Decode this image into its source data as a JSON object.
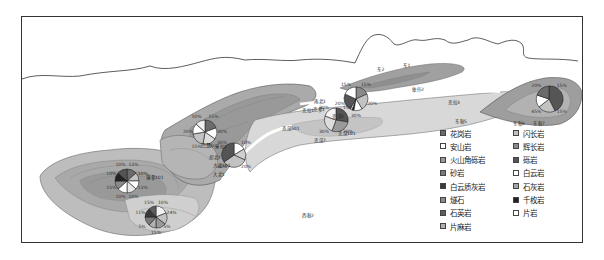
{
  "figure": {
    "frame_color": "#333333",
    "background": "#ffffff"
  },
  "wells": [
    {
      "id": "w1",
      "label": "蒲参1",
      "pie": {
        "cx": 127,
        "cy": 181,
        "r": 12
      },
      "pcts": [
        "13%",
        "10%",
        "13%",
        "10%",
        "10%",
        "15%",
        "10%",
        "10%"
      ]
    },
    {
      "id": "w2",
      "label": "玛参1",
      "pie": {
        "cx": 156,
        "cy": 217,
        "r": 11
      },
      "pcts": [
        "10%",
        "24%",
        "5%",
        "15%",
        "5%",
        "11%",
        "15%"
      ]
    },
    {
      "id": "w3",
      "label": "大北1",
      "pie": {
        "cx": 234,
        "cy": 155,
        "r": 12
      },
      "pcts": [
        "10%",
        "20%",
        "40%",
        "30%"
      ]
    },
    {
      "id": "w4",
      "label": "克深1",
      "pie": {
        "cx": 205,
        "cy": 132,
        "r": 12
      },
      "pcts": [
        "15%",
        "30%",
        "17%",
        "15%",
        "20%",
        "10%"
      ]
    },
    {
      "id": "w5",
      "label": "克拉2",
      "pie": {
        "cx": 356,
        "cy": 99,
        "r": 12
      },
      "pcts": [
        "15%",
        "20%",
        "30%",
        "20%",
        "15%"
      ]
    },
    {
      "id": "w6",
      "label": "克参1",
      "pie": {
        "cx": 336,
        "cy": 120,
        "r": 12
      },
      "pcts": [
        "15%",
        "20%",
        "30%",
        "30%"
      ]
    },
    {
      "id": "w7",
      "label": "东秋1",
      "pie": {
        "cx": 549,
        "cy": 99,
        "r": 13
      },
      "pcts": [
        "15%",
        "15%",
        "45%",
        "20%"
      ]
    }
  ],
  "place_labels": [
    {
      "text": "东2",
      "x": 377,
      "y": 67
    },
    {
      "text": "东1",
      "x": 403,
      "y": 63
    },
    {
      "text": "依什2",
      "x": 412,
      "y": 87
    },
    {
      "text": "克拉3",
      "x": 448,
      "y": 100
    },
    {
      "text": "东秋5",
      "x": 455,
      "y": 119
    },
    {
      "text": "东秋6",
      "x": 513,
      "y": 121
    },
    {
      "text": "东秋7",
      "x": 533,
      "y": 121
    },
    {
      "text": "南北1",
      "x": 314,
      "y": 99
    },
    {
      "text": "克拉1",
      "x": 302,
      "y": 108
    },
    {
      "text": "克参1",
      "x": 313,
      "y": 107
    },
    {
      "text": "克深5",
      "x": 332,
      "y": 114
    },
    {
      "text": "克深501",
      "x": 282,
      "y": 126
    },
    {
      "text": "克深101",
      "x": 338,
      "y": 131
    },
    {
      "text": "克深7",
      "x": 314,
      "y": 138
    },
    {
      "text": "巴楚1",
      "x": 201,
      "y": 143
    },
    {
      "text": "牙拉1",
      "x": 215,
      "y": 144
    },
    {
      "text": "却北1",
      "x": 209,
      "y": 155
    },
    {
      "text": "大北101",
      "x": 213,
      "y": 163
    },
    {
      "text": "大北1",
      "x": 213,
      "y": 172
    },
    {
      "text": "蒲参101",
      "x": 146,
      "y": 175
    },
    {
      "text": "西秋2",
      "x": 302,
      "y": 213
    }
  ],
  "legend": {
    "left_column": [
      {
        "label": "花岗岩",
        "color": "#6b6b6b"
      },
      {
        "label": "安山岩",
        "color": "#ffffff"
      },
      {
        "label": "火山角砾岩",
        "color": "#9a9a9a"
      },
      {
        "label": "砂岩",
        "color": "#7a7a7a"
      },
      {
        "label": "白云质灰岩",
        "color": "#3a3a3a"
      },
      {
        "label": "燧石",
        "color": "#8c8c8c"
      },
      {
        "label": "石英岩",
        "color": "#5e5e5e"
      },
      {
        "label": "片麻岩",
        "color": "#b0b0b0"
      }
    ],
    "right_column": [
      {
        "label": "闪长岩",
        "color": "#c2c2c2"
      },
      {
        "label": "辉长岩",
        "color": "#8a8a8a"
      },
      {
        "label": "砾岩",
        "color": "#555555"
      },
      {
        "label": "白云岩",
        "color": "#ffffff"
      },
      {
        "label": "石灰岩",
        "color": "#a6a6a6"
      },
      {
        "label": "千枚岩",
        "color": "#222222"
      },
      {
        "label": "片岩",
        "color": "#ffffff"
      }
    ]
  },
  "chart_data": {
    "type": "pie",
    "title": "",
    "series": [
      {
        "name": "东秋1",
        "values": [
          15,
          15,
          45,
          20
        ],
        "labels": [
          "15%",
          "15%",
          "45%",
          "20%"
        ]
      },
      {
        "name": "克拉2",
        "values": [
          15,
          20,
          30,
          20,
          15
        ],
        "labels": [
          "15%",
          "20%",
          "30%",
          "20%",
          "15%"
        ]
      },
      {
        "name": "克参1",
        "values": [
          15,
          20,
          30,
          30
        ],
        "labels": [
          "15%",
          "20%",
          "30%",
          "30%"
        ]
      },
      {
        "name": "克深1",
        "values": [
          15,
          30,
          17,
          15,
          20,
          10
        ]
      },
      {
        "name": "大北1",
        "values": [
          10,
          20,
          40,
          30
        ]
      },
      {
        "name": "蒲参1",
        "values": [
          13,
          10,
          13,
          10,
          10,
          15,
          10,
          10
        ]
      },
      {
        "name": "玛参1",
        "values": [
          10,
          24,
          5,
          15,
          5,
          11,
          15
        ]
      }
    ],
    "legend": [
      "花岗岩",
      "安山岩",
      "火山角砾岩",
      "砂岩",
      "白云质灰岩",
      "燧石",
      "石英岩",
      "片麻岩",
      "闪长岩",
      "辉长岩",
      "砾岩",
      "白云岩",
      "石灰岩",
      "千枚岩",
      "片岩"
    ]
  }
}
